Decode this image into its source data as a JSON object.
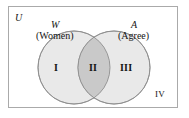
{
  "figure": {
    "type": "venn-diagram",
    "universe": {
      "symbol": "U",
      "label": "IV",
      "label_meaning": "region outside both sets"
    },
    "sets": [
      {
        "symbol": "W",
        "word": "(Women)",
        "side": "left",
        "region_label": "I"
      },
      {
        "symbol": "A",
        "word": "(Agree)",
        "side": "right",
        "region_label": "III"
      }
    ],
    "intersection": {
      "label": "II"
    },
    "colors": {
      "border": "#a9a9a9",
      "circle_stroke": "#8c8c8c",
      "circle_fill": "#e9e9e9",
      "intersection_fill": "#c9c9c9",
      "background": "#ffffff",
      "text": "#141414"
    }
  }
}
